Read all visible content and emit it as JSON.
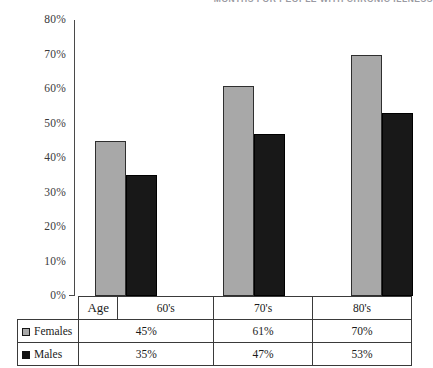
{
  "title": "MONTHS FOR PEOPLE WITH CHRONIC ILLNESS",
  "colors": {
    "females_bar": "#a8a8a8",
    "males_bar": "#181818",
    "axis": "#4a4a4a",
    "table_border": "#3a3a3a",
    "title_text": "#9a9aa2"
  },
  "axis": {
    "tick_labels": [
      "80%",
      "70%",
      "60%",
      "50%",
      "40%",
      "30%",
      "20%",
      "10%",
      "0%"
    ]
  },
  "table": {
    "age_header": "Age",
    "columns": [
      "60's",
      "70's",
      "80's"
    ],
    "rows": [
      {
        "label": "Females",
        "swatch": "gray-square-swatch",
        "values": [
          "45%",
          "61%",
          "70%"
        ]
      },
      {
        "label": "Males",
        "swatch": "black-square-swatch",
        "values": [
          "35%",
          "47%",
          "53%"
        ]
      }
    ]
  },
  "chart_data": {
    "type": "bar",
    "title": "MONTHS FOR PEOPLE WITH CHRONIC ILLNESS",
    "xlabel": "Age",
    "ylabel": "",
    "categories": [
      "60's",
      "70's",
      "80's"
    ],
    "series": [
      {
        "name": "Females",
        "values": [
          45,
          61,
          70
        ],
        "color": "#a8a8a8"
      },
      {
        "name": "Males",
        "values": [
          35,
          47,
          53
        ],
        "color": "#181818"
      }
    ],
    "ylim": [
      0,
      80
    ],
    "ytick_step": 10,
    "yunit": "%",
    "grid": false,
    "legend": "bottom-table"
  }
}
